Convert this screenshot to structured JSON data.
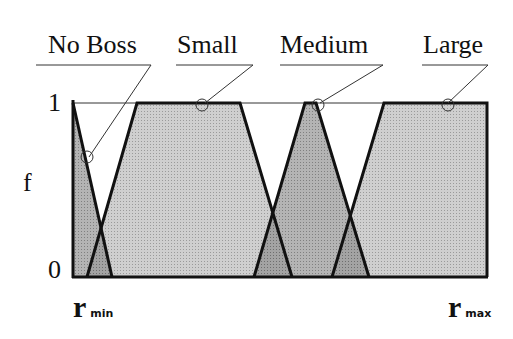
{
  "diagram": {
    "y_axis": {
      "label": "f",
      "ticks": [
        "0",
        "1"
      ]
    },
    "x_axis": {
      "min_label": "r",
      "min_sub": "min",
      "max_label": "r",
      "max_sub": "max"
    },
    "sets": [
      {
        "name": "No Boss",
        "shape": "triangle"
      },
      {
        "name": "Small",
        "shape": "trapezoid"
      },
      {
        "name": "Medium",
        "shape": "triangle"
      },
      {
        "name": "Large",
        "shape": "trapezoid"
      }
    ],
    "colors": {
      "fill_light": "#c8c8c8",
      "fill_overlap": "#8f8f8f",
      "fill_medium": "#a6a6a6",
      "stroke": "#111111"
    }
  }
}
